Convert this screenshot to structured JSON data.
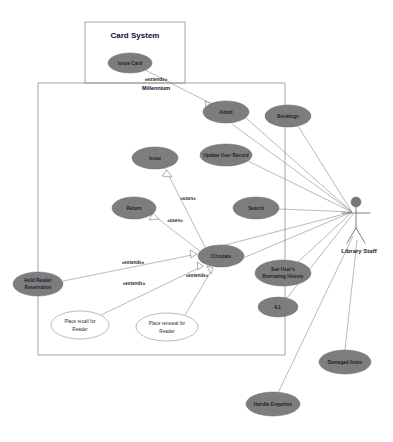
{
  "diagram": {
    "type": "uml-use-case",
    "colors": {
      "usecase_fill": "#7d7d7d",
      "usecase_open_fill": "#ffffff",
      "boundary_stroke": "#8e8e8e",
      "link_stroke": "#8a8a8a",
      "actor_fill": "#777777",
      "background": "#ffffff"
    },
    "boundaries": [
      {
        "id": "card_system",
        "title": "Card System",
        "x": 85,
        "y": 22,
        "w": 100,
        "h": 61
      },
      {
        "id": "millennium",
        "title": "Millennium",
        "x": 38,
        "y": 83,
        "w": 247,
        "h": 272
      }
    ],
    "use_cases": [
      {
        "id": "issue_card",
        "label": "Issue Card",
        "cx": 130,
        "cy": 63,
        "rx": 22,
        "ry": 10,
        "style": "filled"
      },
      {
        "id": "admit",
        "label": "Admit",
        "cx": 226,
        "cy": 112,
        "rx": 23,
        "ry": 11,
        "style": "filled"
      },
      {
        "id": "bookings",
        "label": "Bookings",
        "cx": 288,
        "cy": 116,
        "rx": 23,
        "ry": 11,
        "style": "filled"
      },
      {
        "id": "update_user",
        "label": "Update User Record",
        "cx": 226,
        "cy": 155,
        "rx": 26,
        "ry": 11,
        "style": "filled"
      },
      {
        "id": "issue",
        "label": "Issue",
        "cx": 155,
        "cy": 158,
        "rx": 23,
        "ry": 11,
        "style": "filled"
      },
      {
        "id": "return",
        "label": "Return",
        "cx": 134,
        "cy": 208,
        "rx": 22,
        "ry": 11,
        "style": "filled"
      },
      {
        "id": "search",
        "label": "Search",
        "cx": 256,
        "cy": 208,
        "rx": 23,
        "ry": 11,
        "style": "filled"
      },
      {
        "id": "circulate",
        "label": "Circulate",
        "cx": 221,
        "cy": 256,
        "rx": 23,
        "ry": 11,
        "style": "filled"
      },
      {
        "id": "hold_reader",
        "label_lines": [
          "Hold Reader",
          "Reservation"
        ],
        "label": "Hold Reader Reservation",
        "cx": 38,
        "cy": 284,
        "rx": 25,
        "ry": 12,
        "style": "filled"
      },
      {
        "id": "see_history",
        "label_lines": [
          "See User's",
          "Borrowing History"
        ],
        "label": "See User's Borrowing History",
        "cx": 283,
        "cy": 273,
        "rx": 28,
        "ry": 13,
        "style": "filled"
      },
      {
        "id": "ill",
        "label": "ILL",
        "cx": 278,
        "cy": 307,
        "rx": 20,
        "ry": 10,
        "style": "filled"
      },
      {
        "id": "damaged",
        "label": "Damaged Items",
        "cx": 345,
        "cy": 362,
        "rx": 26,
        "ry": 12,
        "style": "filled"
      },
      {
        "id": "handle_enq",
        "label": "Handle Enquiries",
        "cx": 273,
        "cy": 404,
        "rx": 27,
        "ry": 12,
        "style": "filled"
      },
      {
        "id": "place_recall",
        "label_lines": [
          "Place recall for",
          "Reader"
        ],
        "label": "Place recall for Reader",
        "cx": 80,
        "cy": 325,
        "rx": 29,
        "ry": 14,
        "style": "open"
      },
      {
        "id": "place_renew",
        "label_lines": [
          "Place renewal for",
          "Reader"
        ],
        "label": "Place renewal for Reader",
        "cx": 167,
        "cy": 327,
        "rx": 31,
        "ry": 14,
        "style": "open"
      }
    ],
    "stereotypes": [
      {
        "id": "st_extends_card",
        "text": "«extends»",
        "x": 156,
        "y": 81
      },
      {
        "id": "st_uses_issue",
        "text": "«uses»",
        "x": 188,
        "y": 200
      },
      {
        "id": "st_uses_return",
        "text": "«uses»",
        "x": 175,
        "y": 222
      },
      {
        "id": "st_extends_hold",
        "text": "«extends»",
        "x": 133,
        "y": 264
      },
      {
        "id": "st_extends_recall",
        "text": "«extends»",
        "x": 134,
        "y": 285
      },
      {
        "id": "st_extends_renew",
        "text": "«extends»",
        "x": 197,
        "y": 277
      }
    ],
    "actor": {
      "id": "library_staff",
      "label": "Library Staff",
      "x": 356,
      "y": 202
    },
    "relationships": [
      {
        "from": "issue_card",
        "to": "admit",
        "kind": "extends"
      },
      {
        "from": "issue",
        "to": "circulate",
        "kind": "uses"
      },
      {
        "from": "return",
        "to": "circulate",
        "kind": "uses"
      },
      {
        "from": "hold_reader",
        "to": "circulate",
        "kind": "extends"
      },
      {
        "from": "place_recall",
        "to": "circulate",
        "kind": "extends"
      },
      {
        "from": "place_renew",
        "to": "circulate",
        "kind": "extends"
      },
      {
        "from": "library_staff",
        "to": "admit",
        "kind": "association"
      },
      {
        "from": "library_staff",
        "to": "bookings",
        "kind": "association"
      },
      {
        "from": "library_staff",
        "to": "update_user",
        "kind": "association"
      },
      {
        "from": "library_staff",
        "to": "search",
        "kind": "association"
      },
      {
        "from": "library_staff",
        "to": "circulate",
        "kind": "association"
      },
      {
        "from": "library_staff",
        "to": "see_history",
        "kind": "association"
      },
      {
        "from": "library_staff",
        "to": "ill",
        "kind": "association"
      },
      {
        "from": "library_staff",
        "to": "damaged",
        "kind": "association"
      },
      {
        "from": "library_staff",
        "to": "handle_enq",
        "kind": "association"
      }
    ]
  }
}
